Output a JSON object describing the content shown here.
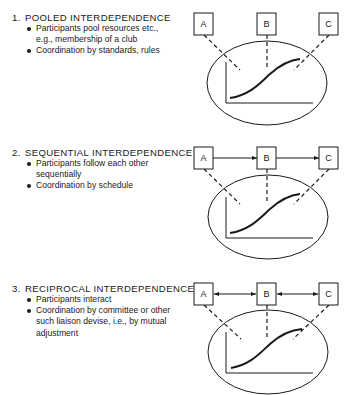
{
  "sections": [
    {
      "number": "1.",
      "title": "POOLED INTERDEPENDENCE",
      "bullets": [
        {
          "lines": [
            "Participants pool resources etc.,",
            "e.g., membership of a club"
          ]
        },
        {
          "lines": [
            "Coordination by standards, rules"
          ]
        }
      ],
      "diagram": {
        "connection": "none",
        "boxes": [
          "A",
          "B",
          "C"
        ]
      }
    },
    {
      "number": "2.",
      "title": "SEQUENTIAL INTERDEPENDENCE",
      "bullets": [
        {
          "lines": [
            "Participants follow each other",
            "sequentially"
          ]
        },
        {
          "lines": [
            "Coordination by schedule"
          ]
        }
      ],
      "diagram": {
        "connection": "one-way arrows A→B→C",
        "boxes": [
          "A",
          "B",
          "C"
        ]
      }
    },
    {
      "number": "3.",
      "title": "RECIPROCAL INTERDEPENDENCE",
      "bullets": [
        {
          "lines": [
            "Participants interact"
          ]
        },
        {
          "lines": [
            "Coordination by committee or other",
            "such liaison devise, i.e., by mutual",
            "adjustment"
          ]
        }
      ],
      "diagram": {
        "connection": "two-way arrows A↔B↔C",
        "boxes": [
          "A",
          "B",
          "C"
        ]
      }
    }
  ],
  "colors": {
    "ink": "#1a1a1a",
    "background": "#ffffff"
  }
}
